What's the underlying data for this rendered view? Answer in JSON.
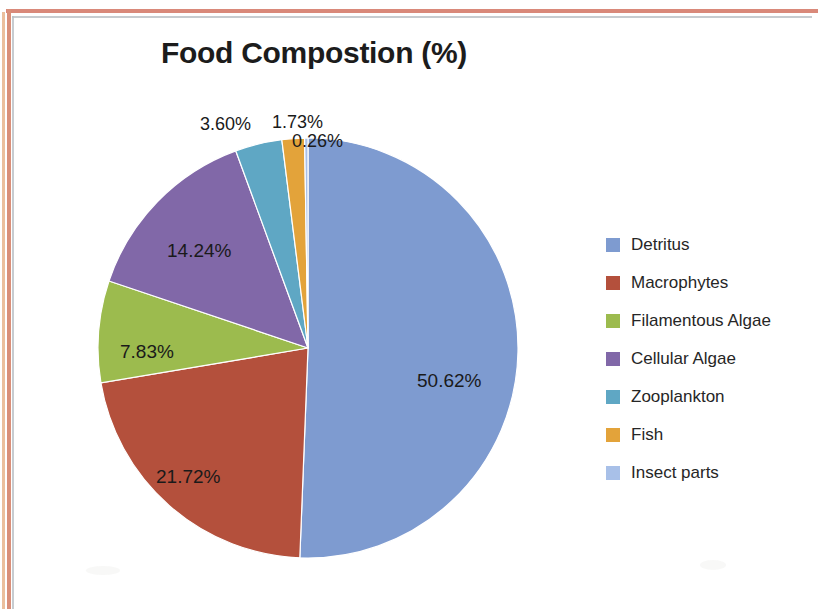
{
  "chart_data": {
    "type": "pie",
    "title": "Food Compostion (%)",
    "xlabel": "",
    "ylabel": "",
    "legend_position": "right",
    "grid": false,
    "units": "percent",
    "start_angle_deg": 0,
    "direction": "clockwise",
    "categories": [
      "Detritus",
      "Macrophytes",
      "Filamentous Algae",
      "Cellular Algae",
      "Zooplankton",
      "Fish",
      "Insect parts"
    ],
    "values": [
      50.62,
      21.72,
      7.83,
      14.24,
      3.6,
      1.73,
      0.26
    ],
    "slices": [
      {
        "label": "Detritus",
        "value": 50.62,
        "value_text": "50.62%",
        "color": "#7e9bd0",
        "label_placement": "inside",
        "label_x": 403,
        "label_y": 352
      },
      {
        "label": "Macrophytes",
        "value": 21.72,
        "value_text": "21.72%",
        "color": "#b4503c",
        "label_placement": "inside",
        "label_x": 142,
        "label_y": 448
      },
      {
        "label": "Filamentous Algae",
        "value": 7.83,
        "value_text": "7.83%",
        "color": "#9cbb4e",
        "label_placement": "inside",
        "label_x": 106,
        "label_y": 323
      },
      {
        "label": "Cellular Algae",
        "value": 14.24,
        "value_text": "14.24%",
        "color": "#8168a8",
        "label_placement": "inside",
        "label_x": 153,
        "label_y": 222
      },
      {
        "label": "Zooplankton",
        "value": 3.6,
        "value_text": "3.60%",
        "color": "#5fa7c4",
        "label_placement": "outside",
        "label_x": 186,
        "label_y": 96
      },
      {
        "label": "Fish",
        "value": 1.73,
        "value_text": "1.73%",
        "color": "#e3a33a",
        "label_placement": "outside",
        "label_x": 258,
        "label_y": 94
      },
      {
        "label": "Insect parts",
        "value": 0.26,
        "value_text": "0.26%",
        "color": "#a8c0e8",
        "label_placement": "outside",
        "label_x": 278,
        "label_y": 113
      }
    ]
  },
  "legend": {
    "items": [
      {
        "label": "Detritus",
        "color": "#7e9bd0"
      },
      {
        "label": "Macrophytes",
        "color": "#b4503c"
      },
      {
        "label": "Filamentous Algae",
        "color": "#9cbb4e"
      },
      {
        "label": "Cellular Algae",
        "color": "#8168a8"
      },
      {
        "label": "Zooplankton",
        "color": "#5fa7c4"
      },
      {
        "label": "Fish",
        "color": "#e3a33a"
      },
      {
        "label": "Insect parts",
        "color": "#a8c0e8"
      }
    ]
  }
}
